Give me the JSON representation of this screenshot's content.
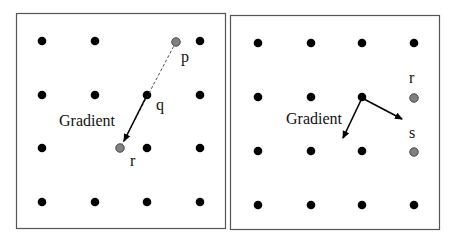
{
  "panels": [
    {
      "id": "left",
      "frame": {
        "x": 16,
        "y": 13,
        "w": 209,
        "h": 215
      },
      "grid": {
        "xs": [
          42,
          95,
          147,
          200
        ],
        "ys": [
          41,
          95,
          148,
          202
        ]
      },
      "omit": [
        [
          2,
          0
        ],
        [
          1,
          2
        ]
      ],
      "special_points": [
        {
          "name": "p",
          "x": 176,
          "y": 42,
          "label": "p",
          "lx": 181,
          "ly": 62,
          "color": "#808080"
        },
        {
          "name": "r",
          "x": 120,
          "y": 148,
          "label": "r",
          "lx": 130,
          "ly": 166,
          "color": "#808080"
        }
      ],
      "labels": [
        {
          "name": "q",
          "text": "q",
          "x": 156,
          "y": 110
        }
      ],
      "gradient_label": {
        "text": "Gradient",
        "x": 59,
        "y": 126
      },
      "arrows": [
        {
          "name": "gradient-arrow",
          "x1": 147,
          "y1": 95,
          "x2": 124,
          "y2": 141,
          "dashed": false
        }
      ],
      "dashed_lines": [
        {
          "name": "p-to-r-line",
          "x1": 176,
          "y1": 42,
          "x2": 120,
          "y2": 148
        }
      ]
    },
    {
      "id": "right",
      "frame": {
        "x": 230,
        "y": 15,
        "w": 209,
        "h": 214
      },
      "grid": {
        "xs": [
          258,
          311,
          362,
          414
        ],
        "ys": [
          43,
          97,
          151,
          205
        ]
      },
      "omit": [
        [
          3,
          1
        ],
        [
          3,
          2
        ]
      ],
      "special_points": [
        {
          "name": "r",
          "x": 414,
          "y": 98,
          "label": "r",
          "lx": 409,
          "ly": 83,
          "color": "#808080"
        },
        {
          "name": "s",
          "x": 414,
          "y": 152,
          "label": "s",
          "lx": 409,
          "ly": 138,
          "color": "#808080"
        }
      ],
      "labels": [],
      "gradient_label": {
        "text": "Gradient",
        "x": 286,
        "y": 124
      },
      "arrows": [
        {
          "name": "gradient-arrow",
          "x1": 362,
          "y1": 98,
          "x2": 343,
          "y2": 138,
          "dashed": false
        },
        {
          "name": "projection-arrow",
          "x1": 362,
          "y1": 98,
          "x2": 402,
          "y2": 119,
          "dashed": false
        }
      ],
      "dashed_lines": []
    }
  ],
  "colors": {
    "dot": "#000000",
    "frame": "#555555",
    "gray_dot": "#808080"
  }
}
